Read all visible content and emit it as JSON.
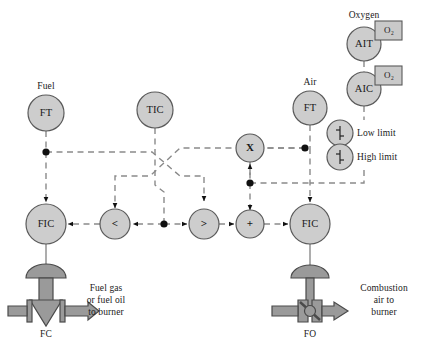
{
  "diagram": {
    "colors": {
      "bubble_fill": "#cdcdcd",
      "bubble_stroke": "#5a5a5a",
      "line": "#8a8a8a",
      "solid_line": "#8a8a8a",
      "pipe_fill": "#9a9a9a",
      "pipe_stroke": "#555555",
      "text": "#1a1a1a",
      "box_fill": "#c9c9c9",
      "dot": "#111111"
    },
    "instruments": [
      {
        "id": "ft-fuel",
        "tag": "FT",
        "label": "Fuel",
        "cx": 46,
        "cy": 113,
        "r": 18
      },
      {
        "id": "tic",
        "tag": "TIC",
        "label": "",
        "cx": 155,
        "cy": 110,
        "r": 18
      },
      {
        "id": "ft-air",
        "tag": "FT",
        "label": "Air",
        "cx": 310,
        "cy": 108,
        "r": 17
      },
      {
        "id": "ait",
        "tag": "AIT",
        "label": "Oxygen",
        "cx": 364,
        "cy": 44,
        "r": 17
      },
      {
        "id": "aic",
        "tag": "AIC",
        "label": "",
        "cx": 364,
        "cy": 89,
        "r": 17
      },
      {
        "id": "fic-fuel",
        "tag": "FIC",
        "label": "",
        "cx": 46,
        "cy": 224,
        "r": 20
      },
      {
        "id": "fic-air",
        "tag": "FIC",
        "label": "",
        "cx": 310,
        "cy": 224,
        "r": 20
      }
    ],
    "computations": [
      {
        "id": "low-select",
        "symbol": "<",
        "cx": 115,
        "cy": 224,
        "r": 15
      },
      {
        "id": "high-select",
        "symbol": ">",
        "cx": 204,
        "cy": 224,
        "r": 15
      },
      {
        "id": "summer",
        "symbol": "+",
        "cx": 250,
        "cy": 224,
        "r": 14
      },
      {
        "id": "multiplier",
        "symbol": "X",
        "cx": 250,
        "cy": 148,
        "r": 14
      }
    ],
    "limits": [
      {
        "id": "low-limit",
        "label": "Low limit",
        "cx": 340,
        "cy": 133,
        "r": 13
      },
      {
        "id": "high-limit",
        "label": "High limit",
        "cx": 340,
        "cy": 157,
        "r": 13
      }
    ],
    "tag_boxes": [
      {
        "id": "o2-ait",
        "label": "O₂",
        "x": 375,
        "y": 21,
        "w": 27,
        "h": 19
      },
      {
        "id": "o2-aic",
        "label": "O₂",
        "x": 375,
        "y": 66,
        "w": 27,
        "h": 19
      }
    ],
    "valves": [
      {
        "id": "fuel-valve",
        "action": "FC",
        "type": "fail-closed",
        "cx": 46,
        "stream": "Fuel gas\nor fuel oil\nto burner",
        "stream_x": 106,
        "stream_y": 301
      },
      {
        "id": "air-valve",
        "action": "FO",
        "type": "fail-open",
        "cx": 310,
        "stream": "Combustion\nair to\nburner",
        "stream_x": 362,
        "stream_y": 301
      }
    ],
    "junctions": [
      {
        "id": "fuel-ft-junction",
        "x": 46,
        "y": 152
      },
      {
        "id": "mid-split",
        "x": 164,
        "y": 224
      },
      {
        "id": "air-ft-junction",
        "x": 305,
        "y": 148
      },
      {
        "id": "aic-junction",
        "x": 310,
        "y": 183
      },
      {
        "id": "mult-out",
        "x": 250,
        "y": 183
      }
    ],
    "labels": {
      "oxygen": "Oxygen",
      "fuel": "Fuel",
      "air": "Air",
      "fc": "FC",
      "fo": "FO",
      "low_limit": "Low limit",
      "high_limit": "High limit",
      "fuel_stream": "Fuel gas\nor fuel oil\nto burner",
      "air_stream": "Combustion\nair to\nburner"
    }
  }
}
